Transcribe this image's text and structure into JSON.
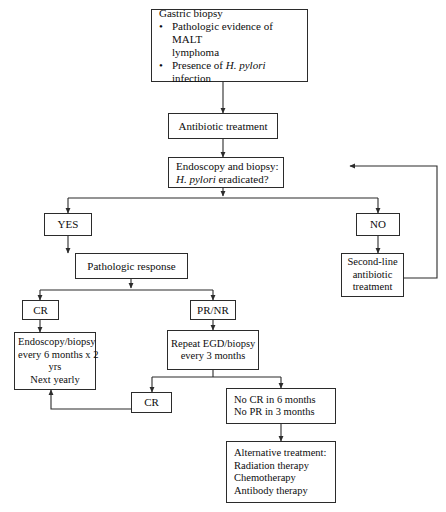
{
  "diagram": {
    "nodes": {
      "gastric_biopsy": {
        "heading": "Gastric biopsy",
        "bullets": [
          {
            "pre": "Pathologic evidence of MALT",
            "cont": "lymphoma"
          },
          {
            "pre": "Presence of ",
            "italic": "H. pylori",
            "post": " infection"
          }
        ]
      },
      "antibiotic_treatment": {
        "line1": "Antibiotic treatment"
      },
      "endoscopy_biopsy": {
        "line1": "Endoscopy and biopsy:",
        "line2_italic": "H. pylori",
        "line2_rest": " eradicated?"
      },
      "yes": {
        "label": "YES"
      },
      "no": {
        "label": "NO"
      },
      "second_line": {
        "line1": "Second-line",
        "line2": "antibiotic",
        "line3": "treatment"
      },
      "pathologic_response": {
        "line1": "Pathologic response"
      },
      "cr_upper": {
        "label": "CR"
      },
      "pr_nr": {
        "label": "PR/NR"
      },
      "surveillance": {
        "line1": "Endoscopy/biopsy",
        "line2": "every 6 months x 2",
        "line3": "yrs",
        "line4": "Next yearly"
      },
      "repeat_egd": {
        "line1": "Repeat EGD/biopsy",
        "line2": "every 3 months"
      },
      "cr_lower": {
        "label": "CR"
      },
      "no_response": {
        "line1": "No CR in 6 months",
        "line2": "No PR in 3 months"
      },
      "alternative_treatment": {
        "line1": "Alternative treatment:",
        "line2": "Radiation therapy",
        "line3": "Chemotherapy",
        "line4": "Antibody therapy"
      }
    },
    "colors": {
      "border": "#2b2b2b",
      "text": "#0d0d0d",
      "background": "#ffffff",
      "connector": "#2b2b2b"
    }
  }
}
